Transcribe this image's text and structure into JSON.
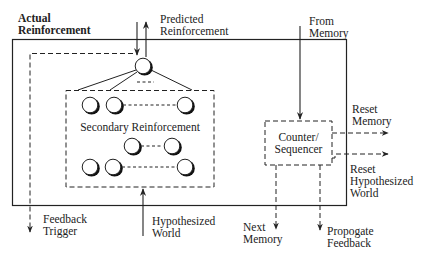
{
  "diagram": {
    "labels": {
      "actual_reinforcement": [
        "Actual",
        "Reinforcement"
      ],
      "predicted_reinforcement": [
        "Predicted",
        "Reinforcement"
      ],
      "from_memory": [
        "From",
        "Memory"
      ],
      "secondary_reinforcement": "Secondary Reinforcement",
      "counter_sequencer": [
        "Counter/",
        "Sequencer"
      ],
      "reset_memory": [
        "Reset",
        "Memory"
      ],
      "reset_hypothesized_world": [
        "Reset",
        "Hypothesized",
        "World"
      ],
      "feedback_trigger": [
        "Feedback",
        "Trigger"
      ],
      "hypothesized_world": [
        "Hypothesized",
        "World"
      ],
      "next_memory": [
        "Next",
        "Memory"
      ],
      "propogate_feedback": [
        "Propogate",
        "Feedback"
      ]
    },
    "colors": {
      "line": "#222222",
      "background": "#ffffff"
    },
    "nodes": {
      "top_node": {
        "cx": 143,
        "cy": 66
      },
      "row1": [
        {
          "cx": 90,
          "cy": 105
        },
        {
          "cx": 114,
          "cy": 105
        },
        {
          "cx": 185,
          "cy": 105
        }
      ],
      "row2": [
        {
          "cx": 132,
          "cy": 146
        },
        {
          "cx": 172,
          "cy": 146
        }
      ],
      "row3": [
        {
          "cx": 90,
          "cy": 167
        },
        {
          "cx": 113,
          "cy": 167
        },
        {
          "cx": 185,
          "cy": 167
        }
      ]
    }
  }
}
